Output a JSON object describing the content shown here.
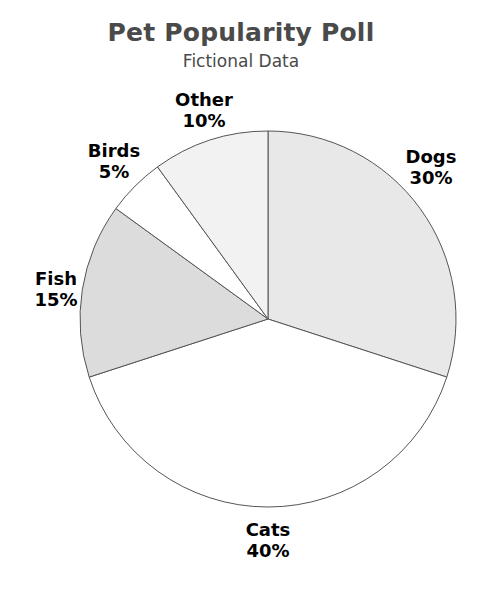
{
  "header": {
    "title": "Pet Popularity Poll",
    "subtitle": "Fictional Data"
  },
  "chart_data": {
    "type": "pie",
    "title": "Pet Popularity Poll",
    "subtitle": "Fictional Data",
    "xlabel": "",
    "ylabel": "",
    "units": "percent",
    "total": 100,
    "start_angle_deg": 90,
    "direction": "clockwise",
    "legend": "none",
    "grid": false,
    "labels_outside": true,
    "categories": [
      "Dogs",
      "Cats",
      "Fish",
      "Birds",
      "Other"
    ],
    "values": [
      30,
      40,
      15,
      5,
      10
    ],
    "value_labels": [
      "30%",
      "40%",
      "15%",
      "5%",
      "10%"
    ],
    "slices": [
      {
        "label": "Dogs",
        "value": 30,
        "value_label": "30%",
        "color": "#e8e8e8",
        "edge_color": "#555555",
        "start_deg": 0,
        "end_deg": 108
      },
      {
        "label": "Cats",
        "value": 40,
        "value_label": "40%",
        "color": "#ffffff",
        "edge_color": "#555555",
        "start_deg": 108,
        "end_deg": 252
      },
      {
        "label": "Fish",
        "value": 15,
        "value_label": "15%",
        "color": "#dcdcdc",
        "edge_color": "#555555",
        "start_deg": 252,
        "end_deg": 306
      },
      {
        "label": "Birds",
        "value": 5,
        "value_label": "5%",
        "color": "#ffffff",
        "edge_color": "#555555",
        "start_deg": 306,
        "end_deg": 324
      },
      {
        "label": "Other",
        "value": 10,
        "value_label": "10%",
        "color": "#f2f2f2",
        "edge_color": "#555555",
        "start_deg": 324,
        "end_deg": 360
      }
    ]
  },
  "colors": {
    "background": "#ffffff",
    "title": "#4a4a4a",
    "label": "#000000",
    "slice_edge": "#555555"
  }
}
